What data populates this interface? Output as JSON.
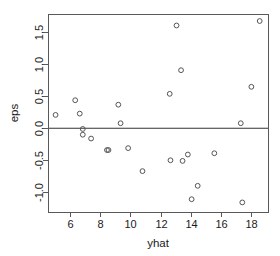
{
  "chart_data": {
    "type": "scatter",
    "title": "",
    "xlabel": "yhat",
    "ylabel": "eps",
    "xlim": [
      4.55,
      19.1
    ],
    "ylim": [
      -1.32,
      1.78
    ],
    "xticks": [
      6,
      8,
      10,
      12,
      14,
      16,
      18
    ],
    "xticklabels": [
      "6",
      "8",
      "10",
      "12",
      "14",
      "16",
      "18"
    ],
    "yticks": [
      -1.0,
      -0.5,
      0.0,
      0.5,
      1.0,
      1.5
    ],
    "yticklabels": [
      "-1.0",
      "-0.5",
      "0.0",
      "0.5",
      "1.0",
      "1.5"
    ],
    "grid": false,
    "legend": null,
    "reference_lines": [
      {
        "orientation": "horizontal",
        "y": 0.0
      }
    ],
    "marker": {
      "shape": "open-circle",
      "radius_px": 2.4,
      "stroke": "#555555",
      "fill": "none"
    },
    "points": [
      {
        "x": 5.05,
        "y": 0.2
      },
      {
        "x": 6.35,
        "y": 0.43
      },
      {
        "x": 6.65,
        "y": 0.22
      },
      {
        "x": 6.85,
        "y": -0.02
      },
      {
        "x": 6.85,
        "y": -0.11
      },
      {
        "x": 7.4,
        "y": -0.17
      },
      {
        "x": 8.45,
        "y": -0.35
      },
      {
        "x": 8.55,
        "y": -0.35
      },
      {
        "x": 9.2,
        "y": 0.36
      },
      {
        "x": 9.35,
        "y": 0.07
      },
      {
        "x": 9.85,
        "y": -0.32
      },
      {
        "x": 10.8,
        "y": -0.68
      },
      {
        "x": 12.6,
        "y": 0.53
      },
      {
        "x": 12.65,
        "y": -0.51
      },
      {
        "x": 13.05,
        "y": 1.6
      },
      {
        "x": 13.35,
        "y": 0.9
      },
      {
        "x": 13.45,
        "y": -0.52
      },
      {
        "x": 13.8,
        "y": -0.42
      },
      {
        "x": 14.05,
        "y": -1.12
      },
      {
        "x": 14.45,
        "y": -0.91
      },
      {
        "x": 15.55,
        "y": -0.4
      },
      {
        "x": 17.3,
        "y": 0.07
      },
      {
        "x": 17.4,
        "y": -1.17
      },
      {
        "x": 18.0,
        "y": 0.64
      },
      {
        "x": 18.55,
        "y": 1.67
      }
    ]
  },
  "colors": {
    "background": "#ffffff",
    "axis": "#595959",
    "marker": "#555555",
    "reference_line": "#333333",
    "text": "#1a1a1a"
  }
}
